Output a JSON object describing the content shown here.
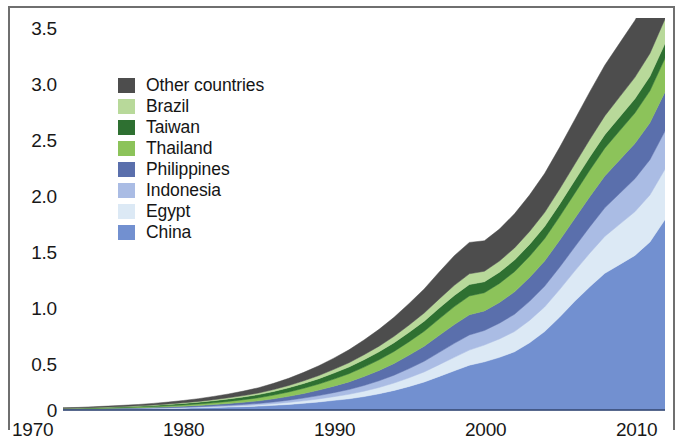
{
  "chart_data": {
    "type": "area",
    "stacked": true,
    "title": "",
    "subtitle": "",
    "xlabel": "",
    "ylabel": "",
    "xlim": [
      1970,
      2010
    ],
    "ylim": [
      0,
      3.5
    ],
    "grid": false,
    "legend_position": "upper-left",
    "x_tick_labels": [
      "1970",
      "1980",
      "1990",
      "2000",
      "2010"
    ],
    "x_ticks": [
      1970,
      1980,
      1990,
      2000,
      2010
    ],
    "y_tick_labels": [
      "3.5",
      "3.0",
      "2.5",
      "2.0",
      "1.5",
      "1.0",
      "0.5",
      "0"
    ],
    "y_ticks": [
      3.5,
      3.0,
      2.5,
      2.0,
      1.5,
      1.0,
      0.5,
      0
    ],
    "x": [
      1970,
      1971,
      1972,
      1973,
      1974,
      1975,
      1976,
      1977,
      1978,
      1979,
      1980,
      1981,
      1982,
      1983,
      1984,
      1985,
      1986,
      1987,
      1988,
      1989,
      1990,
      1991,
      1992,
      1993,
      1994,
      1995,
      1996,
      1997,
      1998,
      1999,
      2000,
      2001,
      2002,
      2003,
      2004,
      2005,
      2006,
      2007,
      2008,
      2009,
      2010
    ],
    "series": [
      {
        "name": "China",
        "color": "#7290d0",
        "values": [
          0.005,
          0.006,
          0.007,
          0.008,
          0.009,
          0.01,
          0.012,
          0.014,
          0.016,
          0.019,
          0.022,
          0.026,
          0.03,
          0.035,
          0.042,
          0.05,
          0.06,
          0.072,
          0.086,
          0.1,
          0.12,
          0.145,
          0.175,
          0.21,
          0.25,
          0.3,
          0.35,
          0.4,
          0.43,
          0.47,
          0.52,
          0.6,
          0.7,
          0.83,
          0.97,
          1.1,
          1.22,
          1.3,
          1.38,
          1.5,
          1.7
        ]
      },
      {
        "name": "Egypt",
        "color": "#dce9f5",
        "values": [
          0.001,
          0.001,
          0.001,
          0.002,
          0.002,
          0.002,
          0.003,
          0.003,
          0.004,
          0.005,
          0.006,
          0.007,
          0.009,
          0.011,
          0.014,
          0.018,
          0.022,
          0.027,
          0.033,
          0.04,
          0.048,
          0.056,
          0.066,
          0.078,
          0.09,
          0.105,
          0.12,
          0.135,
          0.15,
          0.165,
          0.18,
          0.2,
          0.22,
          0.245,
          0.27,
          0.3,
          0.33,
          0.36,
          0.39,
          0.42,
          0.45
        ]
      },
      {
        "name": "Indonesia",
        "color": "#aabce4",
        "values": [
          0.001,
          0.001,
          0.001,
          0.002,
          0.002,
          0.003,
          0.003,
          0.004,
          0.005,
          0.006,
          0.007,
          0.009,
          0.011,
          0.013,
          0.016,
          0.02,
          0.025,
          0.03,
          0.036,
          0.043,
          0.051,
          0.06,
          0.07,
          0.082,
          0.095,
          0.11,
          0.125,
          0.135,
          0.13,
          0.14,
          0.155,
          0.17,
          0.185,
          0.2,
          0.215,
          0.235,
          0.255,
          0.275,
          0.295,
          0.315,
          0.34
        ]
      },
      {
        "name": "Philippines",
        "color": "#5a6fac",
        "values": [
          0.002,
          0.002,
          0.003,
          0.003,
          0.004,
          0.005,
          0.006,
          0.007,
          0.009,
          0.011,
          0.013,
          0.016,
          0.019,
          0.023,
          0.028,
          0.034,
          0.041,
          0.049,
          0.058,
          0.068,
          0.08,
          0.092,
          0.105,
          0.12,
          0.135,
          0.152,
          0.168,
          0.18,
          0.175,
          0.185,
          0.2,
          0.212,
          0.225,
          0.24,
          0.255,
          0.27,
          0.285,
          0.3,
          0.315,
          0.33,
          0.35
        ]
      },
      {
        "name": "Thailand",
        "color": "#8cc35a",
        "values": [
          0.002,
          0.002,
          0.003,
          0.004,
          0.005,
          0.006,
          0.007,
          0.009,
          0.011,
          0.013,
          0.016,
          0.019,
          0.023,
          0.027,
          0.033,
          0.039,
          0.046,
          0.054,
          0.063,
          0.073,
          0.084,
          0.095,
          0.107,
          0.12,
          0.133,
          0.147,
          0.16,
          0.168,
          0.162,
          0.17,
          0.18,
          0.19,
          0.2,
          0.212,
          0.224,
          0.236,
          0.248,
          0.26,
          0.272,
          0.285,
          0.3
        ]
      },
      {
        "name": "Taiwan",
        "color": "#2e7031",
        "values": [
          0.003,
          0.004,
          0.005,
          0.006,
          0.007,
          0.008,
          0.01,
          0.012,
          0.014,
          0.016,
          0.019,
          0.022,
          0.025,
          0.029,
          0.033,
          0.038,
          0.043,
          0.048,
          0.054,
          0.06,
          0.066,
          0.072,
          0.078,
          0.084,
          0.09,
          0.096,
          0.1,
          0.102,
          0.098,
          0.1,
          0.104,
          0.106,
          0.108,
          0.111,
          0.114,
          0.117,
          0.12,
          0.123,
          0.126,
          0.129,
          0.132
        ]
      },
      {
        "name": "Brazil",
        "color": "#b8d99a",
        "values": [
          0.001,
          0.001,
          0.002,
          0.002,
          0.003,
          0.003,
          0.004,
          0.005,
          0.006,
          0.007,
          0.009,
          0.01,
          0.012,
          0.014,
          0.017,
          0.02,
          0.024,
          0.028,
          0.033,
          0.038,
          0.044,
          0.05,
          0.057,
          0.065,
          0.073,
          0.082,
          0.09,
          0.096,
          0.094,
          0.1,
          0.108,
          0.116,
          0.125,
          0.135,
          0.146,
          0.157,
          0.168,
          0.18,
          0.192,
          0.205,
          0.22
        ]
      },
      {
        "name": "Other countries",
        "color": "#4d4d4d",
        "values": [
          0.005,
          0.006,
          0.007,
          0.008,
          0.01,
          0.012,
          0.014,
          0.017,
          0.02,
          0.024,
          0.029,
          0.034,
          0.04,
          0.047,
          0.055,
          0.064,
          0.075,
          0.087,
          0.1,
          0.115,
          0.132,
          0.15,
          0.17,
          0.192,
          0.215,
          0.24,
          0.265,
          0.28,
          0.272,
          0.285,
          0.305,
          0.325,
          0.348,
          0.372,
          0.398,
          0.425,
          0.452,
          0.48,
          0.508,
          0.538,
          0.57
        ]
      }
    ]
  },
  "legend": {
    "items": [
      {
        "label": "Other countries",
        "color": "#4d4d4d"
      },
      {
        "label": "Brazil",
        "color": "#b8d99a"
      },
      {
        "label": "Taiwan",
        "color": "#2e7031"
      },
      {
        "label": "Thailand",
        "color": "#8cc35a"
      },
      {
        "label": "Philippines",
        "color": "#5a6fac"
      },
      {
        "label": "Indonesia",
        "color": "#aabce4"
      },
      {
        "label": "Egypt",
        "color": "#dce9f5"
      },
      {
        "label": "China",
        "color": "#7290d0"
      }
    ]
  },
  "axes": {
    "y_labels": [
      "3.5",
      "3.0",
      "2.5",
      "2.0",
      "1.5",
      "1.0",
      "0.5",
      "0"
    ],
    "x_labels": [
      "1970",
      "1980",
      "1990",
      "2000",
      "2010"
    ]
  }
}
